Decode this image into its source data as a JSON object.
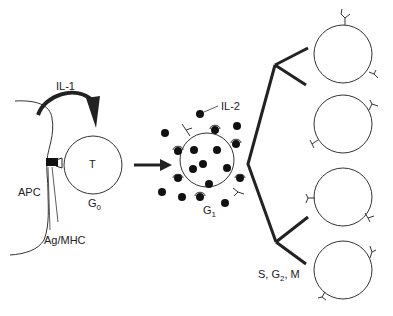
{
  "diagram": {
    "labels": {
      "il1": "IL-1",
      "il2": "IL-2",
      "apc": "APC",
      "t_cell": "T",
      "g0": "G",
      "g0_sub": "0",
      "g1": "G",
      "g1_sub": "1",
      "ag_mhc": "Ag/MHC",
      "phase_prefix": "S, G",
      "phase_sub": "2",
      "phase_suffix": ", M"
    },
    "stages": [
      {
        "name": "resting T cell",
        "phase": "G0"
      },
      {
        "name": "activated T cell with IL-2 receptors",
        "phase": "G1"
      },
      {
        "name": "proliferating daughter cells",
        "phase": "S, G2, M",
        "count": 4
      }
    ],
    "colors": {
      "line": "#222222",
      "background": "#ffffff"
    }
  }
}
